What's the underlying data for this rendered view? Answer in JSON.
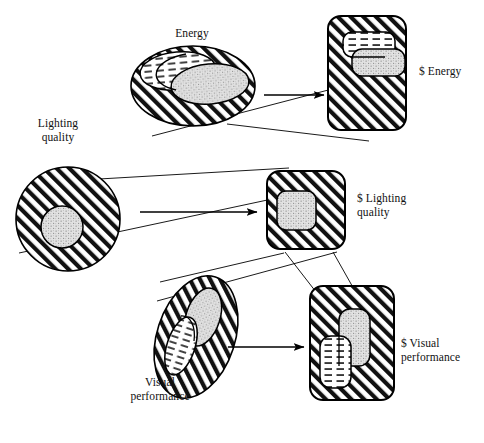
{
  "figure": {
    "type": "concept-diagram",
    "background_color": "#ffffff",
    "ink_color": "#000000",
    "fill_colors": {
      "hatch": "#000000",
      "stipple": "#d9d9d9",
      "dash": "#ffffff",
      "paper": "#ffffff"
    }
  },
  "labels": {
    "energy": "Energy",
    "lighting_quality": "Lighting\nquality",
    "visual_performance": "Visual\nperformance",
    "dollar_energy": "$ Energy",
    "dollar_lighting_quality": "$ Lighting\n    quality",
    "dollar_visual_performance": "$  Visual\nperformance"
  },
  "shapes": {
    "left_column": [
      {
        "name": "energy-ellipse",
        "label": "Energy",
        "form": "ellipse",
        "fill": "hatch",
        "cx": 193,
        "cy": 86,
        "rx": 62,
        "ry": 40,
        "rotation": 0,
        "inner": [
          {
            "name": "energy-inner-dash",
            "form": "ellipse",
            "fill": "dash",
            "cx": 178,
            "cy": 72,
            "rx": 38,
            "ry": 19,
            "rotation": -4
          },
          {
            "name": "energy-inner-stipple",
            "form": "ellipse",
            "fill": "stipple",
            "cx": 209,
            "cy": 84,
            "rx": 39,
            "ry": 20,
            "rotation": -4
          }
        ]
      },
      {
        "name": "lighting-quality-circle",
        "label": "Lighting quality",
        "form": "circle",
        "fill": "hatch",
        "cx": 68,
        "cy": 219,
        "rx": 52,
        "ry": 52,
        "rotation": 0,
        "inner": [
          {
            "name": "lighting-quality-inner-stipple",
            "form": "circle",
            "fill": "stipple",
            "cx": 62,
            "cy": 227,
            "rx": 21,
            "ry": 21,
            "rotation": 0
          }
        ]
      },
      {
        "name": "visual-performance-ellipse",
        "label": "Visual performance",
        "form": "ellipse",
        "fill": "hatch",
        "cx": 196,
        "cy": 337,
        "rx": 39,
        "ry": 63,
        "rotation": 18,
        "inner": [
          {
            "name": "visual-performance-inner-stipple",
            "form": "ellipse",
            "fill": "stipple",
            "cx": 202,
            "cy": 318,
            "rx": 17,
            "ry": 30,
            "rotation": 18
          },
          {
            "name": "visual-performance-inner-dash",
            "form": "ellipse",
            "fill": "dash",
            "cx": 180,
            "cy": 345,
            "rx": 14,
            "ry": 30,
            "rotation": 18
          }
        ]
      }
    ],
    "right_column": [
      {
        "name": "dollar-energy-box",
        "label": "$ Energy",
        "form": "rounded-rect",
        "fill": "hatch",
        "x": 328,
        "y": 16,
        "w": 78,
        "h": 114,
        "r": 12,
        "inner": [
          {
            "name": "dollar-energy-inner-dash",
            "form": "rounded-rect",
            "fill": "dash",
            "x": 343,
            "y": 33,
            "w": 52,
            "h": 24,
            "r": 9
          },
          {
            "name": "dollar-energy-inner-stipple",
            "form": "rounded-rect",
            "fill": "stipple",
            "x": 352,
            "y": 50,
            "w": 53,
            "h": 25,
            "r": 9
          }
        ]
      },
      {
        "name": "dollar-lighting-quality-box",
        "label": "$ Lighting quality",
        "form": "rounded-rect",
        "fill": "hatch",
        "x": 267,
        "y": 171,
        "w": 78,
        "h": 78,
        "r": 12,
        "inner": [
          {
            "name": "dollar-lighting-quality-inner-stipple",
            "form": "rounded-rect",
            "fill": "stipple",
            "x": 277,
            "y": 192,
            "w": 38,
            "h": 38,
            "r": 9
          }
        ]
      },
      {
        "name": "dollar-visual-performance-box",
        "label": "$ Visual performance",
        "form": "rounded-rect",
        "fill": "hatch",
        "x": 310,
        "y": 286,
        "w": 84,
        "h": 114,
        "r": 12,
        "inner": [
          {
            "name": "dollar-visual-performance-inner-stipple",
            "form": "rounded-rect",
            "fill": "stipple",
            "x": 339,
            "y": 310,
            "w": 30,
            "h": 56,
            "r": 10
          },
          {
            "name": "dollar-visual-performance-inner-dash",
            "form": "rounded-rect",
            "fill": "dash",
            "x": 320,
            "y": 336,
            "w": 30,
            "h": 52,
            "r": 10
          }
        ]
      }
    ],
    "arrows": [
      {
        "name": "arrow-energy",
        "x1": 264,
        "y1": 95,
        "x2": 325,
        "y2": 95
      },
      {
        "name": "arrow-lighting-quality",
        "x1": 140,
        "y1": 212,
        "x2": 258,
        "y2": 212
      },
      {
        "name": "arrow-visual-performance",
        "x1": 228,
        "y1": 347,
        "x2": 305,
        "y2": 347
      }
    ],
    "correspondence_lines": [
      {
        "name": "corr-line-energy-a",
        "x1": 152,
        "y1": 136,
        "x2": 336,
        "y2": 88
      },
      {
        "name": "corr-line-energy-b",
        "x1": 227,
        "y1": 124,
        "x2": 369,
        "y2": 140
      },
      {
        "name": "corr-line-lighting-a",
        "x1": 30,
        "y1": 182,
        "x2": 288,
        "y2": 168
      },
      {
        "name": "corr-line-lighting-b",
        "x1": 18,
        "y1": 253,
        "x2": 332,
        "y2": 186
      },
      {
        "name": "corr-line-visual-a",
        "x1": 160,
        "y1": 282,
        "x2": 283,
        "y2": 253
      },
      {
        "name": "corr-line-visual-b",
        "x1": 158,
        "y1": 300,
        "x2": 337,
        "y2": 253
      },
      {
        "name": "corr-line-visual-c",
        "x1": 285,
        "y1": 252,
        "x2": 322,
        "y2": 300
      },
      {
        "name": "corr-line-visual-d",
        "x1": 333,
        "y1": 252,
        "x2": 354,
        "y2": 290
      }
    ]
  },
  "label_positions": {
    "energy": {
      "x": 152,
      "y": 33
    },
    "lighting_quality": {
      "x": 20,
      "y": 124
    },
    "visual_performance": {
      "x": 113,
      "y": 383
    },
    "dollar_energy": {
      "x": 419,
      "y": 66
    },
    "dollar_lighting_quality": {
      "x": 357,
      "y": 193
    },
    "dollar_visual_performance": {
      "x": 403,
      "y": 338
    }
  }
}
